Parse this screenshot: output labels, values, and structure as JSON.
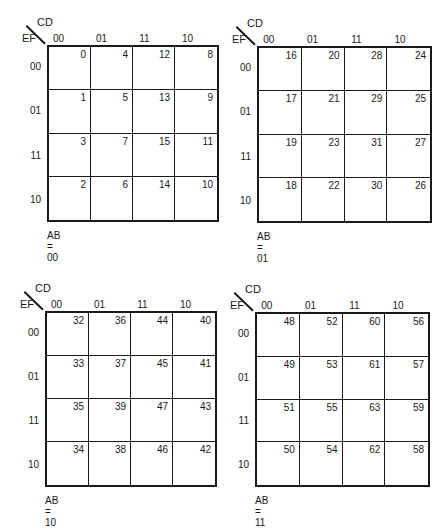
{
  "axis": {
    "col_var": "CD",
    "row_var": "EF",
    "col_labels": [
      "00",
      "01",
      "11",
      "10"
    ],
    "row_labels": [
      "00",
      "01",
      "11",
      "10"
    ]
  },
  "maps": [
    {
      "caption": "AB = 00",
      "cells": [
        [
          "0",
          "4",
          "12",
          "8"
        ],
        [
          "1",
          "5",
          "13",
          "9"
        ],
        [
          "3",
          "7",
          "15",
          "11"
        ],
        [
          "2",
          "6",
          "14",
          "10"
        ]
      ]
    },
    {
      "caption": "AB = 01",
      "cells": [
        [
          "16",
          "20",
          "28",
          "24"
        ],
        [
          "17",
          "21",
          "29",
          "25"
        ],
        [
          "19",
          "23",
          "31",
          "27"
        ],
        [
          "18",
          "22",
          "30",
          "26"
        ]
      ]
    },
    {
      "caption": "AB = 10",
      "cells": [
        [
          "32",
          "36",
          "44",
          "40"
        ],
        [
          "33",
          "37",
          "45",
          "41"
        ],
        [
          "35",
          "39",
          "47",
          "43"
        ],
        [
          "34",
          "38",
          "46",
          "42"
        ]
      ]
    },
    {
      "caption": "AB = 11",
      "cells": [
        [
          "48",
          "52",
          "60",
          "56"
        ],
        [
          "49",
          "53",
          "61",
          "57"
        ],
        [
          "51",
          "55",
          "63",
          "59"
        ],
        [
          "50",
          "54",
          "62",
          "58"
        ]
      ]
    }
  ]
}
